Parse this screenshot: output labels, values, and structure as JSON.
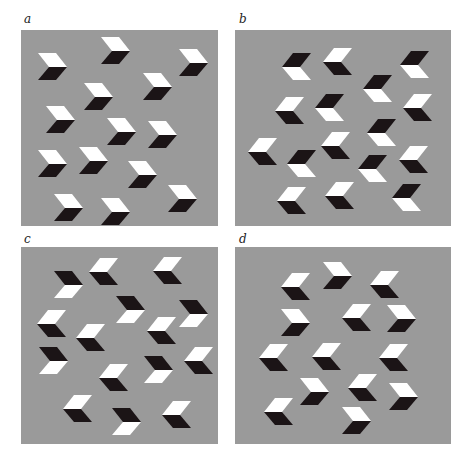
{
  "colors": {
    "background": "#ffffff",
    "panel_gray": "#9a9a9a",
    "white_face": "#ffffff",
    "black_face": "#1b1416"
  },
  "shape": {
    "width": 29,
    "height": 27,
    "description": "chevron made of two stacked parallelograms"
  },
  "panels": [
    {
      "id": "a",
      "label": "a",
      "label_pos": [
        24,
        13
      ],
      "rect": [
        21,
        30,
        197,
        196
      ],
      "chevrons": [
        {
          "x": 38,
          "y": 53,
          "dir": "right",
          "top": "white"
        },
        {
          "x": 101,
          "y": 37,
          "dir": "right",
          "top": "white"
        },
        {
          "x": 179,
          "y": 49,
          "dir": "right",
          "top": "white"
        },
        {
          "x": 84,
          "y": 83,
          "dir": "right",
          "top": "white"
        },
        {
          "x": 143,
          "y": 73,
          "dir": "right",
          "top": "white"
        },
        {
          "x": 46,
          "y": 106,
          "dir": "right",
          "top": "white"
        },
        {
          "x": 107,
          "y": 118,
          "dir": "right",
          "top": "white"
        },
        {
          "x": 148,
          "y": 121,
          "dir": "right",
          "top": "white"
        },
        {
          "x": 38,
          "y": 150,
          "dir": "right",
          "top": "white"
        },
        {
          "x": 79,
          "y": 147,
          "dir": "right",
          "top": "white"
        },
        {
          "x": 128,
          "y": 161,
          "dir": "right",
          "top": "white"
        },
        {
          "x": 54,
          "y": 194,
          "dir": "right",
          "top": "white"
        },
        {
          "x": 101,
          "y": 198,
          "dir": "right",
          "top": "white"
        },
        {
          "x": 168,
          "y": 185,
          "dir": "right",
          "top": "white"
        }
      ]
    },
    {
      "id": "b",
      "label": "b",
      "label_pos": [
        239,
        13
      ],
      "rect": [
        235,
        30,
        216,
        196
      ],
      "chevrons": [
        {
          "x": 282,
          "y": 53,
          "dir": "left",
          "top": "black"
        },
        {
          "x": 323,
          "y": 48,
          "dir": "left",
          "top": "white"
        },
        {
          "x": 400,
          "y": 51,
          "dir": "left",
          "top": "black"
        },
        {
          "x": 363,
          "y": 75,
          "dir": "left",
          "top": "black"
        },
        {
          "x": 275,
          "y": 97,
          "dir": "left",
          "top": "white"
        },
        {
          "x": 315,
          "y": 94,
          "dir": "left",
          "top": "black"
        },
        {
          "x": 403,
          "y": 94,
          "dir": "left",
          "top": "white"
        },
        {
          "x": 367,
          "y": 119,
          "dir": "left",
          "top": "black"
        },
        {
          "x": 248,
          "y": 138,
          "dir": "left",
          "top": "white"
        },
        {
          "x": 287,
          "y": 150,
          "dir": "left",
          "top": "black"
        },
        {
          "x": 321,
          "y": 132,
          "dir": "left",
          "top": "white"
        },
        {
          "x": 358,
          "y": 155,
          "dir": "left",
          "top": "black"
        },
        {
          "x": 399,
          "y": 146,
          "dir": "left",
          "top": "white"
        },
        {
          "x": 277,
          "y": 187,
          "dir": "left",
          "top": "white"
        },
        {
          "x": 325,
          "y": 182,
          "dir": "left",
          "top": "white"
        },
        {
          "x": 392,
          "y": 184,
          "dir": "left",
          "top": "black"
        }
      ]
    },
    {
      "id": "c",
      "label": "c",
      "label_pos": [
        24,
        233
      ],
      "rect": [
        21,
        247,
        197,
        197
      ],
      "chevrons": [
        {
          "x": 54,
          "y": 271,
          "dir": "right",
          "top": "black"
        },
        {
          "x": 89,
          "y": 258,
          "dir": "left",
          "top": "white"
        },
        {
          "x": 153,
          "y": 257,
          "dir": "left",
          "top": "white"
        },
        {
          "x": 116,
          "y": 296,
          "dir": "right",
          "top": "black"
        },
        {
          "x": 179,
          "y": 300,
          "dir": "right",
          "top": "black"
        },
        {
          "x": 37,
          "y": 310,
          "dir": "left",
          "top": "white"
        },
        {
          "x": 76,
          "y": 324,
          "dir": "left",
          "top": "white"
        },
        {
          "x": 147,
          "y": 317,
          "dir": "left",
          "top": "white"
        },
        {
          "x": 39,
          "y": 347,
          "dir": "right",
          "top": "black"
        },
        {
          "x": 99,
          "y": 364,
          "dir": "left",
          "top": "white"
        },
        {
          "x": 144,
          "y": 356,
          "dir": "right",
          "top": "black"
        },
        {
          "x": 184,
          "y": 347,
          "dir": "left",
          "top": "white"
        },
        {
          "x": 63,
          "y": 395,
          "dir": "left",
          "top": "white"
        },
        {
          "x": 112,
          "y": 408,
          "dir": "right",
          "top": "black"
        },
        {
          "x": 162,
          "y": 401,
          "dir": "left",
          "top": "white"
        }
      ]
    },
    {
      "id": "d",
      "label": "d",
      "label_pos": [
        239,
        233
      ],
      "rect": [
        235,
        247,
        216,
        197
      ],
      "chevrons": [
        {
          "x": 281,
          "y": 273,
          "dir": "left",
          "top": "white"
        },
        {
          "x": 323,
          "y": 262,
          "dir": "right",
          "top": "white"
        },
        {
          "x": 370,
          "y": 271,
          "dir": "left",
          "top": "white"
        },
        {
          "x": 281,
          "y": 309,
          "dir": "right",
          "top": "white"
        },
        {
          "x": 342,
          "y": 304,
          "dir": "left",
          "top": "white"
        },
        {
          "x": 387,
          "y": 305,
          "dir": "right",
          "top": "white"
        },
        {
          "x": 259,
          "y": 344,
          "dir": "left",
          "top": "white"
        },
        {
          "x": 312,
          "y": 343,
          "dir": "left",
          "top": "white"
        },
        {
          "x": 379,
          "y": 344,
          "dir": "left",
          "top": "white"
        },
        {
          "x": 300,
          "y": 378,
          "dir": "right",
          "top": "white"
        },
        {
          "x": 348,
          "y": 374,
          "dir": "left",
          "top": "white"
        },
        {
          "x": 389,
          "y": 383,
          "dir": "right",
          "top": "white"
        },
        {
          "x": 264,
          "y": 398,
          "dir": "left",
          "top": "white"
        },
        {
          "x": 342,
          "y": 407,
          "dir": "right",
          "top": "white"
        }
      ]
    }
  ]
}
